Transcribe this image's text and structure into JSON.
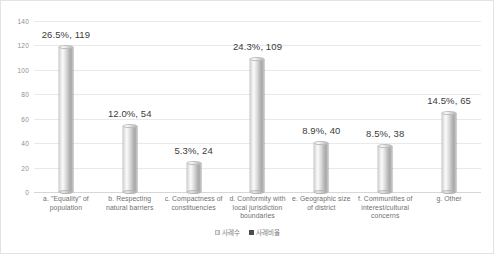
{
  "chart_data": {
    "type": "bar",
    "title": "",
    "subtitle": "",
    "xlabel": "",
    "ylabel": "",
    "ylim": [
      0,
      140
    ],
    "ytick_step": 20,
    "yticks": [
      "140",
      "120",
      "100",
      "80",
      "60",
      "40",
      "20",
      "0"
    ],
    "grid": true,
    "legend_position": "bottom",
    "categories": [
      "a. \"Equality\" of population",
      "b. Respecting natural barriers",
      "c. Compactness of constituencies",
      "d. Conformity with local jurisdiction boundaries",
      "e. Geographic size of district",
      "f. Communities of interest/cultural concerns",
      "g. Other"
    ],
    "category_lines": [
      [
        "a. \"Equality\" of",
        "population"
      ],
      [
        "b. Respecting",
        "natural barriers"
      ],
      [
        "c. Compactness of",
        "constituencies"
      ],
      [
        "d. Conformity with",
        "local jurisdiction",
        "boundaries"
      ],
      [
        "e. Geographic size",
        "of district"
      ],
      [
        "f. Communities of",
        "interest/cultural",
        "concerns"
      ],
      [
        "g. Other"
      ]
    ],
    "series": [
      {
        "name": "사례수",
        "values": [
          119,
          54,
          24,
          109,
          40,
          38,
          65
        ]
      },
      {
        "name": "사례비율",
        "values": [
          26.5,
          12.0,
          5.3,
          24.3,
          8.9,
          8.5,
          14.5
        ]
      }
    ],
    "data_labels": [
      "26.5%, 119",
      "12.0%, 54",
      "5.3%, 24",
      "24.3%, 109",
      "8.9%, 40",
      "8.5%, 38",
      "14.5%, 65"
    ],
    "bar_color": "#cfcfcf",
    "grid_color": "#e9e9e9",
    "label_color": "#3b3b3b"
  },
  "legend": {
    "entries": [
      {
        "label": "사례수",
        "color": "#dcdcdc"
      },
      {
        "label": "사례비율",
        "color": "#4c4c4c"
      }
    ]
  }
}
